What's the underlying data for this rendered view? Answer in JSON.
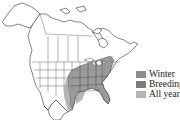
{
  "map": {
    "region": "North America",
    "type": "species range map",
    "range_color_all_year": "#8a8a8a",
    "range_color_winter": "#a9a9a9",
    "outline_color": "#333333"
  },
  "legend": {
    "items": [
      {
        "label": "Winter",
        "color": "#8c8c8c"
      },
      {
        "label": "Breeding",
        "color": "#7d7d7d"
      },
      {
        "label": "All year",
        "color": "#b4b4b4"
      }
    ]
  }
}
